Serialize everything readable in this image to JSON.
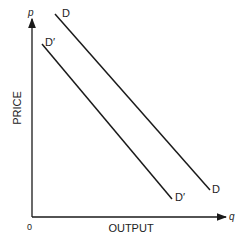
{
  "diagram": {
    "type": "demand-shift",
    "axes": {
      "y_symbol": "p",
      "x_symbol": "q",
      "y_label": "PRICE",
      "x_label": "OUTPUT",
      "origin_label": "0"
    },
    "curves": [
      {
        "name": "D",
        "label_start": "D",
        "label_end": "D",
        "from": [
          55,
          14
        ],
        "to": [
          210,
          190
        ]
      },
      {
        "name": "D'",
        "label_start": "D′",
        "label_end": "D′",
        "from": [
          42,
          44
        ],
        "to": [
          172,
          199
        ]
      }
    ],
    "colors": {
      "line": "#1a1a1a",
      "text": "#222222"
    }
  }
}
